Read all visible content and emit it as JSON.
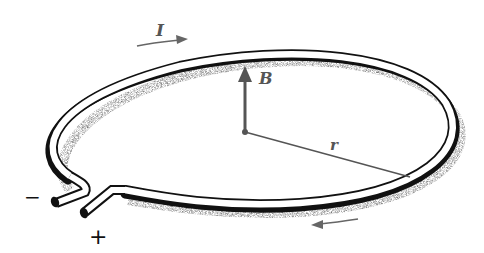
{
  "diagram": {
    "labels": {
      "current": "I",
      "field": "B",
      "radius": "r",
      "minus_terminal": "−",
      "plus_terminal": "+"
    },
    "colors": {
      "wire_outline": "#111111",
      "arrows": "#666666",
      "labels": "#555555",
      "shadow": "#999999"
    }
  }
}
